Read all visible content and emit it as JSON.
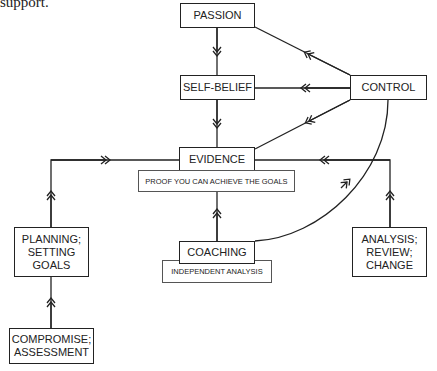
{
  "caption": "support.",
  "nodes": {
    "passion": "PASSION",
    "self_belief": "SELF-BELIEF",
    "control": "CONTROL",
    "evidence": "EVIDENCE",
    "evidence_note": "PROOF YOU CAN ACHIEVE THE GOALS",
    "planning": "PLANNING;\nSETTING\nGOALS",
    "compromise": "COMPROMISE;\nASSESSMENT",
    "coaching": "COACHING",
    "coaching_note": "INDEPENDENT ANALYSIS",
    "analysis": "ANALYSIS;\nREVIEW;\nCHANGE"
  },
  "edges": [
    {
      "from": "PASSION",
      "to": "SELF-BELIEF"
    },
    {
      "from": "SELF-BELIEF",
      "to": "EVIDENCE"
    },
    {
      "from": "CONTROL",
      "to": "PASSION"
    },
    {
      "from": "CONTROL",
      "to": "SELF-BELIEF"
    },
    {
      "from": "CONTROL",
      "to": "EVIDENCE"
    },
    {
      "from": "COACHING",
      "to": "EVIDENCE"
    },
    {
      "from": "COACHING",
      "to": "CONTROL"
    },
    {
      "from": "PLANNING; SETTING GOALS",
      "to": "EVIDENCE"
    },
    {
      "from": "COMPROMISE; ASSESSMENT",
      "to": "PLANNING; SETTING GOALS"
    },
    {
      "from": "ANALYSIS; REVIEW; CHANGE",
      "to": "EVIDENCE"
    }
  ],
  "colors": {
    "line": "#222222",
    "background": "#ffffff"
  }
}
